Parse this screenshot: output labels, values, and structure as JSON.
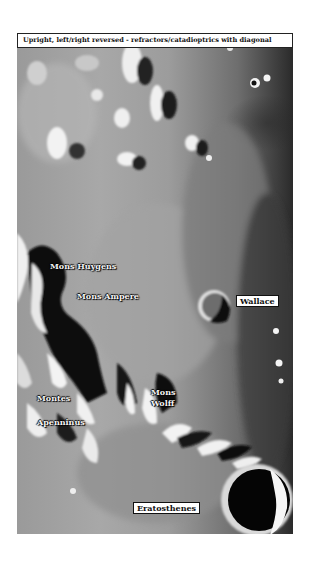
{
  "header": {
    "caption": "Upright, left/right reversed - refractors/catadioptrics with diagonal"
  },
  "image": {
    "subject": "lunar surface map",
    "labels": [
      {
        "id": "mons-huygens",
        "text": "Mons Huygens",
        "style": "shadowed"
      },
      {
        "id": "mons-ampere",
        "text": "Mons Ampere",
        "style": "shadowed"
      },
      {
        "id": "wallace",
        "text": "Wallace",
        "style": "boxed"
      },
      {
        "id": "montes",
        "text": "Montes",
        "style": "shadowed"
      },
      {
        "id": "apenninus",
        "text": "Apenninus",
        "style": "shadowed"
      },
      {
        "id": "mons",
        "text": "Mons",
        "style": "shadowed"
      },
      {
        "id": "wolff",
        "text": "Wolff",
        "style": "shadowed"
      },
      {
        "id": "eratosthenes",
        "text": "Eratosthenes",
        "style": "boxed"
      }
    ]
  }
}
